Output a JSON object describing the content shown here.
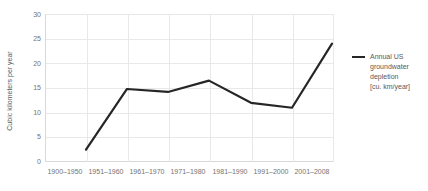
{
  "chart_data": {
    "type": "line",
    "title": "",
    "xlabel": "",
    "ylabel": "Cubic kilometers per year",
    "categories": [
      "1900–1950",
      "1951–1960",
      "1961–1970",
      "1971–1980",
      "1981–1990",
      "1991–2000",
      "2001–2008"
    ],
    "series": [
      {
        "name": "Annual US groundwater depletion [cu. km/year]",
        "values": [
          2.5,
          14.8,
          14.2,
          16.5,
          12.0,
          11.0,
          24.0
        ],
        "color": "#262626"
      }
    ],
    "ylim": [
      0,
      30
    ],
    "yticks": [
      0,
      5,
      10,
      15,
      20,
      25,
      30
    ],
    "ytick_labels": [
      "0",
      "5",
      "10",
      "15",
      "20",
      "25",
      "30"
    ],
    "grid": true,
    "legend_position": "right"
  },
  "legend": {
    "lines": [
      "Annual US",
      "groundwater",
      "depletion",
      "[cu. km/year]"
    ]
  }
}
